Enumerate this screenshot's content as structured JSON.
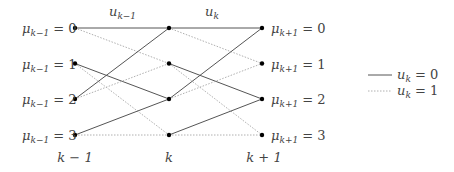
{
  "diagram": {
    "type": "trellis",
    "columns": [
      {
        "index": 0,
        "x": 75,
        "time_label": "k − 1",
        "state_label_prefix": "μ",
        "state_label_sub": "k−1",
        "label_side": "left"
      },
      {
        "index": 1,
        "x": 169,
        "time_label": "k",
        "label_side": "none"
      },
      {
        "index": 2,
        "x": 262,
        "time_label": "k + 1",
        "state_label_prefix": "μ",
        "state_label_sub": "k+1",
        "label_side": "right"
      }
    ],
    "rows_y": [
      28,
      63.5,
      99,
      135
    ],
    "states": [
      "0",
      "1",
      "2",
      "3"
    ],
    "left_labels": [
      "μk−1 = 0",
      "μk−1 = 1",
      "μk−1 = 2",
      "μk−1 = 3"
    ],
    "right_labels": [
      "μk+1 = 0",
      "μk+1 = 1",
      "μk+1 = 2",
      "μk+1 = 3"
    ],
    "transition_labels": [
      {
        "base": "u",
        "sub": "k−1",
        "x": 122
      },
      {
        "base": "u",
        "sub": "k",
        "x": 214
      }
    ],
    "time_labels": [
      "k − 1",
      "k",
      "k + 1"
    ],
    "edges": [
      {
        "from": 0,
        "to": 0,
        "input": 0
      },
      {
        "from": 0,
        "to": 1,
        "input": 1
      },
      {
        "from": 1,
        "to": 2,
        "input": 0
      },
      {
        "from": 1,
        "to": 3,
        "input": 1
      },
      {
        "from": 2,
        "to": 0,
        "input": 0
      },
      {
        "from": 2,
        "to": 1,
        "input": 1
      },
      {
        "from": 3,
        "to": 2,
        "input": 0
      },
      {
        "from": 3,
        "to": 3,
        "input": 1
      }
    ],
    "legend": [
      {
        "style": "solid",
        "label": "uk = 0",
        "base": "u",
        "sub": "k",
        "rhs": "= 0"
      },
      {
        "style": "dotted",
        "label": "uk = 1",
        "base": "u",
        "sub": "k",
        "rhs": "= 1"
      }
    ],
    "colors": {
      "solid_edge": "#555555",
      "dotted_edge": "#b0b0b0",
      "node": "#000000",
      "text": "#444444"
    }
  }
}
